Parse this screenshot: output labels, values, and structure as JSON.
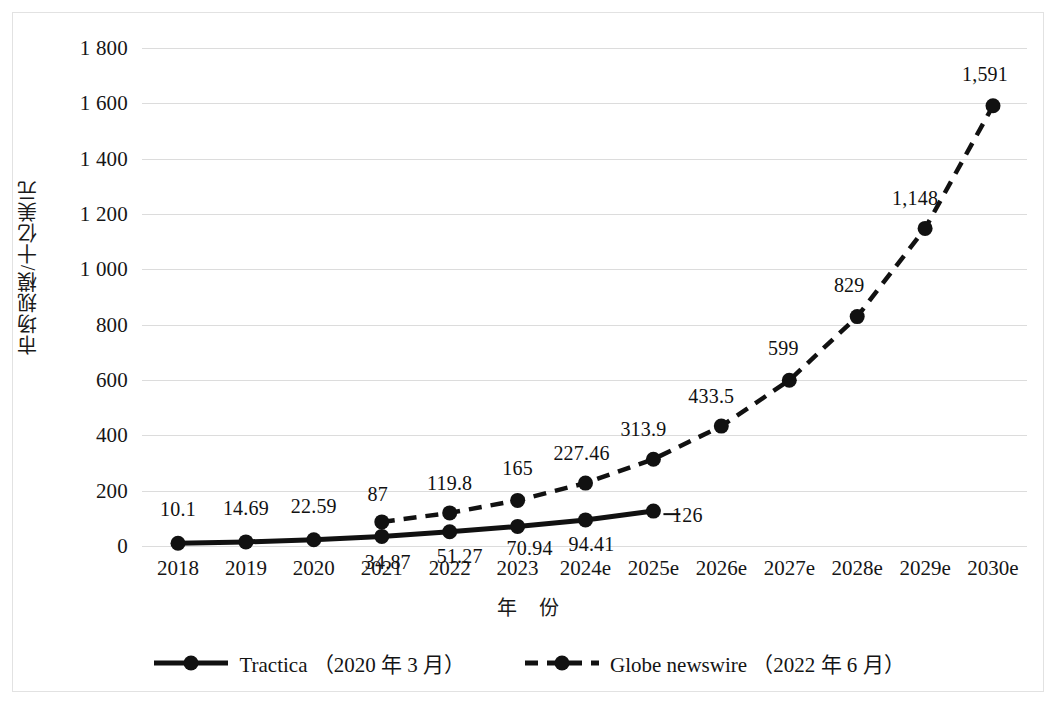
{
  "chart_data": {
    "type": "line",
    "title": "",
    "xlabel": "年　份",
    "ylabel": "市场规模/十亿美元",
    "categories": [
      "2018",
      "2019",
      "2020",
      "2021",
      "2022",
      "2023",
      "2024e",
      "2025e",
      "2026e",
      "2027e",
      "2028e",
      "2029e",
      "2030e"
    ],
    "ylim": [
      0,
      1800
    ],
    "ytick_values": [
      0,
      200,
      400,
      600,
      800,
      1000,
      1200,
      1400,
      1600,
      1800
    ],
    "ytick_labels": [
      "0",
      "200",
      "400",
      "600",
      "800",
      "1 000",
      "1 200",
      "1 400",
      "1 600",
      "1 800"
    ],
    "grid": true,
    "legend_position": "bottom",
    "series": [
      {
        "name": "Tractica （2020 年 3 月）",
        "style": "solid",
        "marker": "circle",
        "color": "#111111",
        "x": [
          "2018",
          "2019",
          "2020",
          "2021",
          "2022",
          "2023",
          "2024e",
          "2025e"
        ],
        "values": [
          10.1,
          14.69,
          22.59,
          34.87,
          51.27,
          70.94,
          94.41,
          126
        ],
        "labels": [
          "10.1",
          "14.69",
          "22.59",
          "34.87",
          "51.27",
          "70.94",
          "94.41",
          "126"
        ]
      },
      {
        "name": "Globe newswire （2022 年 6 月）",
        "style": "dashed",
        "marker": "circle",
        "color": "#111111",
        "x": [
          "2021",
          "2022",
          "2023",
          "2024e",
          "2025e",
          "2026e",
          "2027e",
          "2028e",
          "2029e",
          "2030e"
        ],
        "values": [
          87,
          119.8,
          165,
          227.46,
          313.9,
          433.5,
          599,
          829,
          1148,
          1591
        ],
        "labels": [
          "87",
          "119.8",
          "165",
          "227.46",
          "313.9",
          "433.5",
          "599",
          "829",
          "1,148",
          "1,591"
        ]
      }
    ]
  },
  "axes": {
    "y_title": "市场规模/十亿美元",
    "x_title": "年　份"
  },
  "legend": {
    "items": [
      {
        "label": "Tractica （2020 年 3 月）",
        "style": "solid"
      },
      {
        "label": "Globe newswire （2022 年 6 月）",
        "style": "dashed"
      }
    ]
  },
  "colors": {
    "series": "#111111",
    "grid": "#dcdcdc",
    "frame": "#e2e2e2",
    "text": "#161616"
  }
}
